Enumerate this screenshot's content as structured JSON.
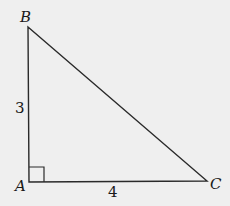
{
  "diagram": {
    "type": "right-triangle",
    "background": "#efefef",
    "stroke_color": "#2a2a2a",
    "vertices": {
      "A": {
        "label": "A",
        "x": 29,
        "y": 182
      },
      "B": {
        "label": "B",
        "x": 28,
        "y": 27
      },
      "C": {
        "label": "C",
        "x": 207,
        "y": 181
      }
    },
    "side_labels": {
      "AB": "3",
      "AC": "4"
    },
    "right_angle_at": "A"
  }
}
